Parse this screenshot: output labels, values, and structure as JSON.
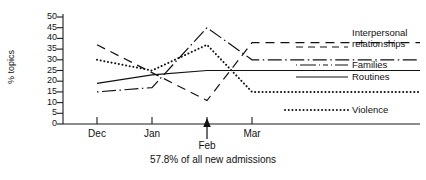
{
  "chart_data": {
    "type": "line",
    "title": "",
    "subtitle": "",
    "xlabel": "",
    "ylabel": "% topics",
    "ylim": [
      0,
      50
    ],
    "ytick_step": 5,
    "yticks": [
      "0",
      "5",
      "10",
      "15",
      "20",
      "25",
      "30",
      "35",
      "40",
      "45",
      "50"
    ],
    "categories": [
      "Dec",
      "Jan",
      "Feb",
      "Mar"
    ],
    "x": [
      0,
      1,
      2,
      3
    ],
    "grid": false,
    "legend_position": "right",
    "annotation": "57.8% of all new admissions",
    "marker_annotation": {
      "at_category": "Feb",
      "type": "up-arrow"
    },
    "series": [
      {
        "name": "Interpersonal relationships",
        "style": "dashed",
        "values": [
          37,
          24,
          11,
          38
        ],
        "extend_right_value": 38
      },
      {
        "name": "Families",
        "style": "dash-dot",
        "values": [
          15,
          17,
          45,
          30
        ],
        "extend_right_value": 30
      },
      {
        "name": "Routines",
        "style": "solid",
        "values": [
          19,
          23,
          25,
          25
        ],
        "extend_right_value": 25
      },
      {
        "name": "Violence",
        "style": "dotted",
        "values": [
          30,
          25,
          37,
          15
        ],
        "extend_right_value": 15
      }
    ]
  },
  "axis": {
    "y_label": "% topics",
    "y_ticks": [
      "50",
      "45",
      "40",
      "35",
      "30",
      "25",
      "20",
      "15",
      "10",
      "5",
      "0"
    ],
    "x_ticks": [
      "Dec",
      "Jan",
      "Feb",
      "Mar"
    ]
  },
  "legend": {
    "items": [
      {
        "label_line1": "Interpersonal",
        "label_line2": "relationships",
        "style": "dashed"
      },
      {
        "label_line1": "Families",
        "label_line2": "",
        "style": "dash-dot"
      },
      {
        "label_line1": "Routines",
        "label_line2": "",
        "style": "solid"
      },
      {
        "label_line1": "Violence",
        "label_line2": "",
        "style": "dotted"
      }
    ]
  },
  "caption": {
    "text": "57.8% of all new admissions"
  }
}
